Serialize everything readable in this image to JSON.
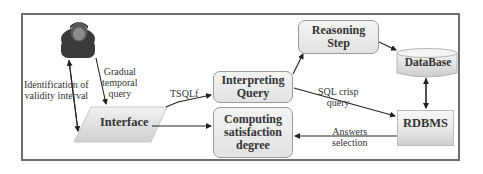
{
  "diagram": {
    "type": "system-architecture-flow",
    "nodes": {
      "user": {
        "label": "",
        "icon": "user-icon"
      },
      "interface": {
        "label": "Interface",
        "shape": "parallelogram"
      },
      "interpreting_query": {
        "label_line1": "Interpreting",
        "label_line2": "Query",
        "shape": "rounded-rect"
      },
      "computing_satisfaction": {
        "label_line1": "Computing",
        "label_line2": "satisfaction",
        "label_line3": "degree",
        "shape": "rounded-rect"
      },
      "reasoning_step": {
        "label_line1": "Reasoning",
        "label_line2": "Step",
        "shape": "rounded-rect"
      },
      "database": {
        "label": "DataBase",
        "shape": "cylinder"
      },
      "rdbms": {
        "label": "RDBMS",
        "shape": "rect"
      }
    },
    "edges": [
      {
        "from": "user",
        "to": "interface",
        "label_line1": "Gradual",
        "label_line2": "temporal",
        "label_line3": "query"
      },
      {
        "from": "interface",
        "to": "user",
        "bidirectional": true,
        "label_line1": "Identification of",
        "label_line2": "validity interval"
      },
      {
        "from": "interface",
        "to": "interpreting_query",
        "label": "TSQLf"
      },
      {
        "from": "interface",
        "to": "computing_satisfaction",
        "label": ""
      },
      {
        "from": "interpreting_query",
        "to": "reasoning_step",
        "label": ""
      },
      {
        "from": "reasoning_step",
        "to": "database",
        "label": ""
      },
      {
        "from": "interpreting_query",
        "to": "rdbms",
        "label_line1": "SQL crisp",
        "label_line2": "query"
      },
      {
        "from": "database",
        "to": "rdbms",
        "bidirectional": true,
        "label": ""
      },
      {
        "from": "rdbms",
        "to": "computing_satisfaction",
        "label_line1": "Answers",
        "label_line2": "selection"
      }
    ]
  },
  "colors": {
    "frame": "#6e6e6e",
    "box_fill_top": "#f4f4f4",
    "box_fill_bottom": "#e2e2e2",
    "box_border": "#9a9a9a",
    "arrow": "#222222",
    "user_icon": "#3a3a3a"
  }
}
